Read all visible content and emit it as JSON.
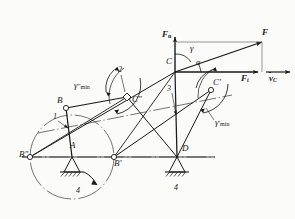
{
  "figure": {
    "type": "kinematic-mechanism-diagram",
    "background_color": "#fbfbf9",
    "line_color": "#1a1a1a"
  },
  "joints": {
    "A": {
      "label": "A",
      "x": 72,
      "y": 157,
      "kind": "fixed-pivot-ground"
    },
    "B": {
      "label": "B",
      "x": 66,
      "y": 108,
      "kind": "moving-pivot"
    },
    "B_prime": {
      "label": "B′",
      "x": 114,
      "y": 157,
      "kind": "moving-pivot"
    },
    "B_dprime": {
      "label": "B″",
      "x": 30,
      "y": 157,
      "kind": "moving-pivot"
    },
    "C": {
      "label": "C",
      "x": 175,
      "y": 72,
      "kind": "moving-pivot"
    },
    "C_prime": {
      "label": "C′",
      "x": 211,
      "y": 90,
      "kind": "moving-pivot"
    },
    "C_dprime": {
      "label": "C″",
      "x": 127,
      "y": 97,
      "kind": "moving-pivot"
    },
    "D": {
      "label": "D",
      "x": 177,
      "y": 157,
      "kind": "fixed-pivot-ground"
    },
    "F_tip": {
      "label": "F",
      "x": 263,
      "y": 41,
      "kind": "vector-tip"
    }
  },
  "link_numbers": {
    "link1": "1",
    "link2": "2",
    "link3": "3",
    "ground_left": "4",
    "ground_right": "4"
  },
  "forces": {
    "F": "F",
    "F_n": "F",
    "F_n_sub": "n",
    "F_t": "F",
    "F_t_sub": "t",
    "v_C": "v",
    "v_C_sub": "C"
  },
  "angles": {
    "gamma": "γ",
    "alpha": "α",
    "gamma_min_dprime": "γ",
    "gamma_min_dprime_sup": "″",
    "gamma_min_prime": "γ",
    "gamma_min_prime_sup": "′",
    "min_sub": "min"
  },
  "rotation_arrow": {
    "name": "crank-rotation-direction",
    "direction": "clockwise"
  }
}
